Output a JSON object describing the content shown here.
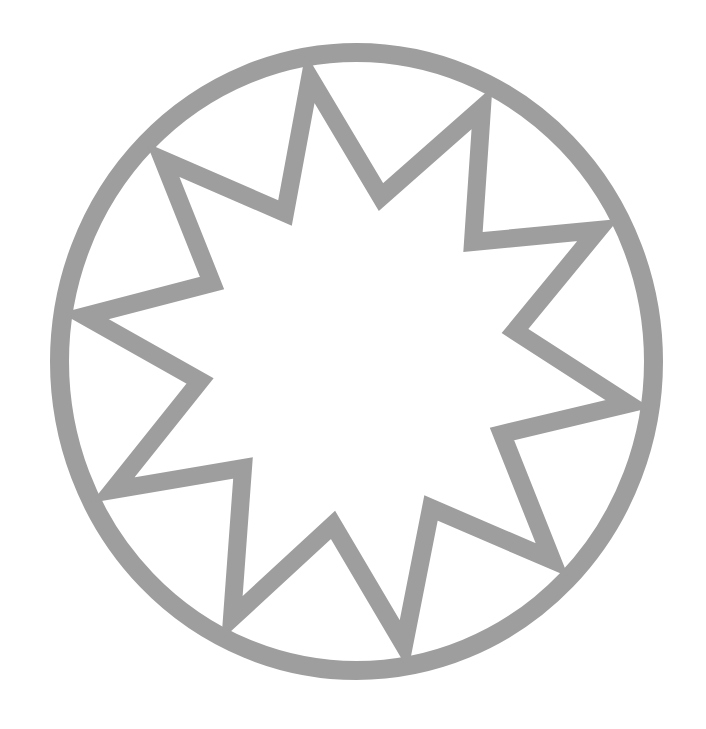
{
  "figure": {
    "stroke_color": "#9e9e9e",
    "background_color": "#ffffff",
    "ring": {
      "cx": 356.5,
      "cy": 361.5,
      "rx": 297,
      "ry": 309,
      "stroke_width": 19
    },
    "star": {
      "points_count": 10,
      "stroke_width": 18,
      "points": "310,78 381,197 482,108 473,242 598,230 515,331 628,404 502,434 552,560 431,508 404,645 333,525 232,618 243,468 113,490 200,381 85,316 212,283 163,160 285,213"
    }
  }
}
